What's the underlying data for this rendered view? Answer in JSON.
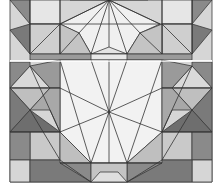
{
  "image": {
    "description": "Geometric tiling pattern with radiating star motifs",
    "colors": {
      "background": "#ffffff",
      "lightest": "#f2f2f2",
      "light": "#d9d9d9",
      "mid": "#b8b8b8",
      "dark": "#8a8a8a",
      "darkest": "#6e6e6e",
      "line": "#333333"
    }
  }
}
